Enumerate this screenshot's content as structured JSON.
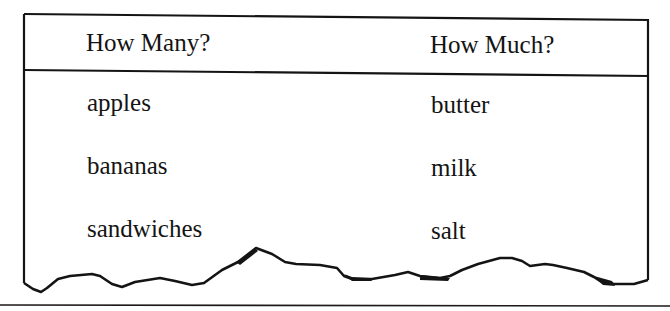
{
  "table": {
    "columns": [
      "How Many?",
      "How Much?"
    ],
    "rows": [
      [
        "apples",
        "butter"
      ],
      [
        "bananas",
        "milk"
      ],
      [
        "sandwiches",
        "salt"
      ]
    ]
  },
  "colors": {
    "ink": "#141414",
    "background": "#ffffff"
  }
}
